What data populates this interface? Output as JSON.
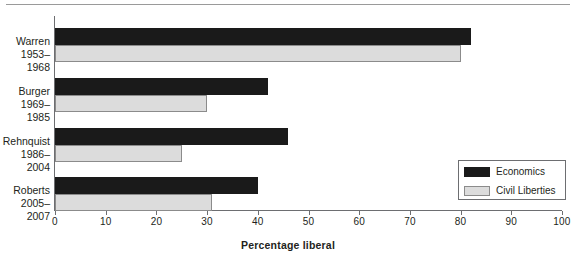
{
  "chart_data": {
    "type": "bar",
    "orientation": "horizontal",
    "title": "",
    "xlabel": "Percentage liberal",
    "ylabel": "",
    "xlim": [
      0,
      100
    ],
    "xticks": [
      0,
      10,
      20,
      30,
      40,
      50,
      60,
      70,
      80,
      90,
      100
    ],
    "xticklabels": [
      "0",
      "10",
      "20",
      "30",
      "40",
      "50",
      "60",
      "70",
      "80",
      "90",
      "100"
    ],
    "grid": false,
    "legend_position": "right-inside",
    "categories": [
      {
        "name": "Warren",
        "years": "1953–1968"
      },
      {
        "name": "Burger",
        "years": "1969–1985"
      },
      {
        "name": "Rehnquist",
        "years": "1986–2004"
      },
      {
        "name": "Roberts",
        "years": "2005–2007"
      }
    ],
    "series": [
      {
        "name": "Economics",
        "color": "#1a1a1a",
        "values": [
          82,
          42,
          46,
          40
        ]
      },
      {
        "name": "Civil Liberties",
        "color": "#dcdcdc",
        "values": [
          80,
          30,
          25,
          31
        ]
      }
    ]
  },
  "legend": {
    "items": [
      {
        "label": "Economics",
        "swatch": "econ"
      },
      {
        "label": "Civil Liberties",
        "swatch": "civ"
      }
    ]
  }
}
